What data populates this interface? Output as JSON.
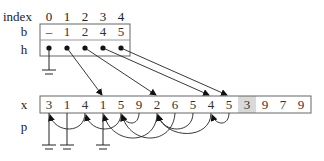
{
  "top_table": {
    "index_label": "index",
    "index_values": [
      "0",
      "1",
      "2",
      "3",
      "4"
    ],
    "b_label": "b",
    "b_values": [
      "–",
      "1",
      "2",
      "4",
      "5"
    ],
    "h_label": "h"
  },
  "array": {
    "x_label": "x",
    "p_label": "p",
    "x_values": [
      "3",
      "1",
      "4",
      "1",
      "5",
      "9",
      "2",
      "6",
      "5",
      "4",
      "5",
      "3",
      "9",
      "7",
      "9"
    ],
    "highlighted_index": 11,
    "highlight_color": "#d9d9d9"
  },
  "h_pointers": [
    {
      "from_h": 0,
      "to": "ground"
    },
    {
      "from_h": 1,
      "to_x": 3
    },
    {
      "from_h": 2,
      "to_x": 6
    },
    {
      "from_h": 3,
      "to_x": 9
    },
    {
      "from_h": 4,
      "to_x": 10
    }
  ],
  "p_links": [
    {
      "from_x": 0,
      "to": "ground"
    },
    {
      "from_x": 1,
      "to": "ground"
    },
    {
      "from_x": 2,
      "to_x": 0
    },
    {
      "from_x": 3,
      "to": "ground"
    },
    {
      "from_x": 4,
      "to_x": 2
    },
    {
      "from_x": 5,
      "to_x": 4
    },
    {
      "from_x": 6,
      "to_x": 3
    },
    {
      "from_x": 7,
      "to_x": 4
    },
    {
      "from_x": 8,
      "to_x": 6
    },
    {
      "from_x": 9,
      "to_x": 6
    },
    {
      "from_x": 10,
      "to_x": 9
    }
  ]
}
